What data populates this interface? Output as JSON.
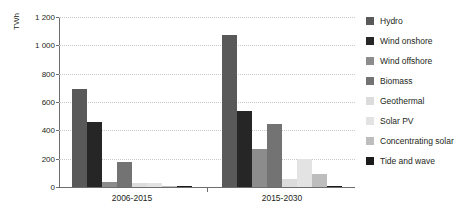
{
  "chart_data": {
    "type": "bar",
    "title": "in the reference scenario",
    "ylabel": "TWh",
    "xlabel": "",
    "categories": [
      "2006-2015",
      "2015-2030"
    ],
    "ylim": [
      0,
      1200
    ],
    "yticks": [
      0,
      200,
      400,
      600,
      800,
      1000,
      1200
    ],
    "ytick_labels": [
      "0",
      "200",
      "400",
      "600",
      "800",
      "1 000",
      "1 200"
    ],
    "grid": true,
    "legend_position": "right",
    "series": [
      {
        "name": "Hydro",
        "color": "#595959",
        "values": [
          695,
          1070
        ]
      },
      {
        "name": "Wind onshore",
        "color": "#262626",
        "values": [
          460,
          535
        ]
      },
      {
        "name": "Wind offshore",
        "color": "#8c8c8c",
        "values": [
          35,
          270
        ]
      },
      {
        "name": "Biomass",
        "color": "#737373",
        "values": [
          180,
          445
        ]
      },
      {
        "name": "Geothermal",
        "color": "#dcdcdc",
        "values": [
          25,
          60
        ]
      },
      {
        "name": "Solar PV",
        "color": "#e3e3e3",
        "values": [
          25,
          195
        ]
      },
      {
        "name": "Concentrating solar",
        "color": "#bdbdbd",
        "values": [
          5,
          90
        ]
      },
      {
        "name": "Tide and wave",
        "color": "#1a1a1a",
        "values": [
          2,
          10
        ]
      }
    ]
  }
}
